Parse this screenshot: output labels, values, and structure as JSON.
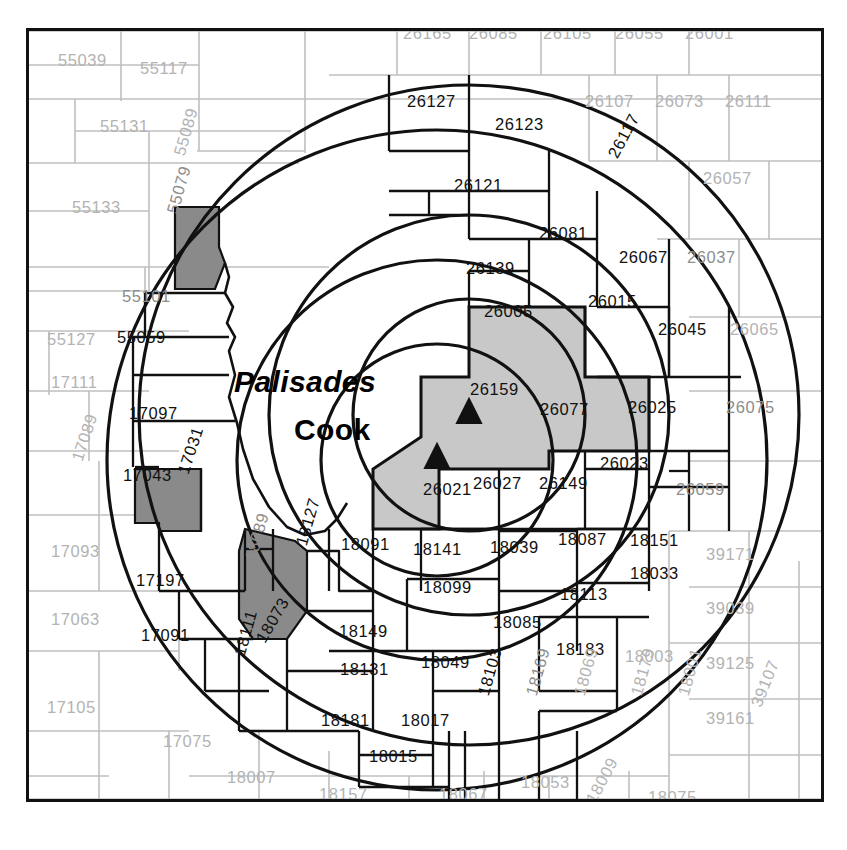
{
  "map": {
    "title": "Nuclear plant emergency planning zone map",
    "width": 847,
    "height": 850,
    "frame": {
      "x": 26,
      "y": 28,
      "w": 792,
      "h": 768
    },
    "background_color": "#ffffff",
    "border_color": "#111111",
    "county_line_inside_color": "#111111",
    "county_line_outside_color": "#b9b9b9",
    "shade_light": "#c8c8c8",
    "shade_dark": "#8a8a8a"
  },
  "sites": [
    {
      "name": "Palisades",
      "label": "Palisades",
      "marker": "triangle-marker",
      "x": 440,
      "y": 384,
      "label_x": 231,
      "label_y": 353
    },
    {
      "name": "Cook",
      "label": "Cook",
      "marker": "triangle-marker",
      "x": 408,
      "y": 429,
      "label_x": 290,
      "label_y": 400
    }
  ],
  "rings": [
    {
      "site": "Palisades",
      "cx": 440,
      "cy": 384,
      "r": 330,
      "name": "palisades-outer-ring"
    },
    {
      "site": "Palisades",
      "cx": 440,
      "cy": 384,
      "r": 200,
      "name": "palisades-mid-ring"
    },
    {
      "site": "Palisades",
      "cx": 440,
      "cy": 384,
      "r": 116,
      "name": "palisades-inner-ring"
    },
    {
      "site": "Cook",
      "cx": 408,
      "cy": 429,
      "r": 330,
      "name": "cook-outer-ring"
    },
    {
      "site": "Cook",
      "cx": 408,
      "cy": 429,
      "r": 200,
      "name": "cook-mid-ring"
    },
    {
      "site": "Cook",
      "cx": 408,
      "cy": 429,
      "r": 116,
      "name": "cook-inner-ring"
    }
  ],
  "shaded_counties": {
    "light": [
      "26005",
      "26159",
      "26077",
      "26021"
    ],
    "dark": [
      "55079",
      "17043",
      "18089"
    ]
  },
  "counties": [
    {
      "fips": "55039",
      "x": 55,
      "y": 49,
      "tone": "outside",
      "rot": 0
    },
    {
      "fips": "55117",
      "x": 137,
      "y": 57,
      "tone": "outside",
      "rot": 0
    },
    {
      "fips": "55131",
      "x": 97,
      "y": 115,
      "tone": "outside",
      "rot": 0
    },
    {
      "fips": "55089",
      "x": 168,
      "y": 150,
      "tone": "outside",
      "rot": -74
    },
    {
      "fips": "55133",
      "x": 69,
      "y": 196,
      "tone": "outside",
      "rot": 0
    },
    {
      "fips": "55079",
      "x": 161,
      "y": 208,
      "tone": "mid",
      "rot": -74
    },
    {
      "fips": "55127",
      "x": 44,
      "y": 328,
      "tone": "outside",
      "rot": 0
    },
    {
      "fips": "55101",
      "x": 119,
      "y": 285,
      "tone": "mid",
      "rot": 0
    },
    {
      "fips": "55059",
      "x": 114,
      "y": 326,
      "tone": "inside",
      "rot": 0
    },
    {
      "fips": "17111",
      "x": 48,
      "y": 371,
      "tone": "outside",
      "rot": 0
    },
    {
      "fips": "17097",
      "x": 126,
      "y": 402,
      "tone": "inside",
      "rot": 0
    },
    {
      "fips": "17089",
      "x": 66,
      "y": 455,
      "tone": "outside",
      "rot": -72
    },
    {
      "fips": "17043",
      "x": 120,
      "y": 464,
      "tone": "inside",
      "rot": 0
    },
    {
      "fips": "17031",
      "x": 172,
      "y": 468,
      "tone": "inside",
      "rot": -72
    },
    {
      "fips": "17093",
      "x": 48,
      "y": 540,
      "tone": "outside",
      "rot": 0
    },
    {
      "fips": "17063",
      "x": 48,
      "y": 608,
      "tone": "outside",
      "rot": 0
    },
    {
      "fips": "17197",
      "x": 133,
      "y": 569,
      "tone": "inside",
      "rot": 0
    },
    {
      "fips": "17091",
      "x": 138,
      "y": 624,
      "tone": "inside",
      "rot": 0
    },
    {
      "fips": "17105",
      "x": 44,
      "y": 696,
      "tone": "outside",
      "rot": 0
    },
    {
      "fips": "17075",
      "x": 160,
      "y": 730,
      "tone": "outside",
      "rot": 0
    },
    {
      "fips": "17053",
      "x": 54,
      "y": 795,
      "tone": "outside",
      "rot": 0
    },
    {
      "fips": "18089",
      "x": 239,
      "y": 555,
      "tone": "mid",
      "rot": -74
    },
    {
      "fips": "18127",
      "x": 290,
      "y": 540,
      "tone": "inside",
      "rot": -74
    },
    {
      "fips": "18073",
      "x": 250,
      "y": 634,
      "tone": "inside",
      "rot": -60
    },
    {
      "fips": "18111",
      "x": 228,
      "y": 650,
      "tone": "inside",
      "rot": -74
    },
    {
      "fips": "18091",
      "x": 338,
      "y": 533,
      "tone": "inside",
      "rot": 0
    },
    {
      "fips": "18141",
      "x": 410,
      "y": 538,
      "tone": "inside",
      "rot": 0
    },
    {
      "fips": "18039",
      "x": 487,
      "y": 536,
      "tone": "inside",
      "rot": 0
    },
    {
      "fips": "18087",
      "x": 555,
      "y": 528,
      "tone": "inside",
      "rot": 0
    },
    {
      "fips": "18151",
      "x": 627,
      "y": 529,
      "tone": "inside",
      "rot": 0
    },
    {
      "fips": "18033",
      "x": 627,
      "y": 562,
      "tone": "inside",
      "rot": 0
    },
    {
      "fips": "18099",
      "x": 420,
      "y": 576,
      "tone": "inside",
      "rot": 0
    },
    {
      "fips": "18113",
      "x": 557,
      "y": 583,
      "tone": "inside",
      "rot": 0
    },
    {
      "fips": "18149",
      "x": 336,
      "y": 620,
      "tone": "inside",
      "rot": 0
    },
    {
      "fips": "18085",
      "x": 490,
      "y": 611,
      "tone": "inside",
      "rot": 0
    },
    {
      "fips": "18183",
      "x": 553,
      "y": 638,
      "tone": "inside",
      "rot": 0
    },
    {
      "fips": "18131",
      "x": 337,
      "y": 658,
      "tone": "inside",
      "rot": 0
    },
    {
      "fips": "18049",
      "x": 418,
      "y": 651,
      "tone": "inside",
      "rot": 0
    },
    {
      "fips": "18003",
      "x": 622,
      "y": 645,
      "tone": "outside",
      "rot": 0
    },
    {
      "fips": "18181",
      "x": 318,
      "y": 709,
      "tone": "inside",
      "rot": 0
    },
    {
      "fips": "18017",
      "x": 398,
      "y": 709,
      "tone": "inside",
      "rot": 0
    },
    {
      "fips": "18015",
      "x": 366,
      "y": 745,
      "tone": "inside",
      "rot": 0
    },
    {
      "fips": "18103",
      "x": 472,
      "y": 690,
      "tone": "inside",
      "rot": -74
    },
    {
      "fips": "18169",
      "x": 520,
      "y": 690,
      "tone": "mid",
      "rot": -74
    },
    {
      "fips": "18069",
      "x": 568,
      "y": 690,
      "tone": "outside",
      "rot": -74
    },
    {
      "fips": "18179",
      "x": 625,
      "y": 690,
      "tone": "outside",
      "rot": -74
    },
    {
      "fips": "18001",
      "x": 672,
      "y": 690,
      "tone": "outside",
      "rot": -74
    },
    {
      "fips": "18007",
      "x": 224,
      "y": 766,
      "tone": "outside",
      "rot": 0
    },
    {
      "fips": "18157",
      "x": 316,
      "y": 783,
      "tone": "outside",
      "rot": 0
    },
    {
      "fips": "18171",
      "x": 232,
      "y": 802,
      "tone": "outside",
      "rot": 0
    },
    {
      "fips": "18067",
      "x": 436,
      "y": 783,
      "tone": "outside",
      "rot": 0
    },
    {
      "fips": "18053",
      "x": 518,
      "y": 771,
      "tone": "outside",
      "rot": 0
    },
    {
      "fips": "18009",
      "x": 580,
      "y": 795,
      "tone": "outside",
      "rot": -62
    },
    {
      "fips": "18075",
      "x": 645,
      "y": 786,
      "tone": "outside",
      "rot": 0
    },
    {
      "fips": "26127",
      "x": 404,
      "y": 90,
      "tone": "inside",
      "rot": 0
    },
    {
      "fips": "26123",
      "x": 492,
      "y": 113,
      "tone": "inside",
      "rot": 0
    },
    {
      "fips": "26107",
      "x": 582,
      "y": 90,
      "tone": "outside",
      "rot": 0
    },
    {
      "fips": "26073",
      "x": 652,
      "y": 90,
      "tone": "outside",
      "rot": 0
    },
    {
      "fips": "26111",
      "x": 722,
      "y": 90,
      "tone": "outside",
      "rot": 0
    },
    {
      "fips": "26121",
      "x": 451,
      "y": 174,
      "tone": "inside",
      "rot": 0
    },
    {
      "fips": "26117",
      "x": 602,
      "y": 150,
      "tone": "inside",
      "rot": -62
    },
    {
      "fips": "26057",
      "x": 700,
      "y": 167,
      "tone": "outside",
      "rot": 0
    },
    {
      "fips": "26081",
      "x": 536,
      "y": 222,
      "tone": "inside",
      "rot": 0
    },
    {
      "fips": "26067",
      "x": 616,
      "y": 246,
      "tone": "inside",
      "rot": 0
    },
    {
      "fips": "26037",
      "x": 684,
      "y": 246,
      "tone": "mid",
      "rot": 0
    },
    {
      "fips": "26139",
      "x": 463,
      "y": 257,
      "tone": "inside",
      "rot": 0
    },
    {
      "fips": "26005",
      "x": 481,
      "y": 300,
      "tone": "inside",
      "rot": 0
    },
    {
      "fips": "26015",
      "x": 585,
      "y": 290,
      "tone": "inside",
      "rot": 0
    },
    {
      "fips": "26045",
      "x": 655,
      "y": 318,
      "tone": "inside",
      "rot": 0
    },
    {
      "fips": "26065",
      "x": 727,
      "y": 318,
      "tone": "outside",
      "rot": 0
    },
    {
      "fips": "26159",
      "x": 467,
      "y": 378,
      "tone": "inside",
      "rot": 0
    },
    {
      "fips": "26077",
      "x": 537,
      "y": 398,
      "tone": "inside",
      "rot": 0
    },
    {
      "fips": "26025",
      "x": 625,
      "y": 396,
      "tone": "inside",
      "rot": 0
    },
    {
      "fips": "26075",
      "x": 723,
      "y": 396,
      "tone": "mid",
      "rot": 0
    },
    {
      "fips": "26021",
      "x": 420,
      "y": 478,
      "tone": "inside",
      "rot": 0
    },
    {
      "fips": "26027",
      "x": 470,
      "y": 472,
      "tone": "inside",
      "rot": 0
    },
    {
      "fips": "26149",
      "x": 536,
      "y": 472,
      "tone": "inside",
      "rot": 0
    },
    {
      "fips": "26023",
      "x": 597,
      "y": 452,
      "tone": "inside",
      "rot": 0
    },
    {
      "fips": "26059",
      "x": 673,
      "y": 478,
      "tone": "mid",
      "rot": 0
    },
    {
      "fips": "39171",
      "x": 703,
      "y": 543,
      "tone": "outside",
      "rot": 0
    },
    {
      "fips": "39039",
      "x": 703,
      "y": 597,
      "tone": "outside",
      "rot": 0
    },
    {
      "fips": "39125",
      "x": 703,
      "y": 652,
      "tone": "outside",
      "rot": 0
    },
    {
      "fips": "39161",
      "x": 703,
      "y": 707,
      "tone": "outside",
      "rot": 0
    },
    {
      "fips": "39107",
      "x": 745,
      "y": 700,
      "tone": "outside",
      "rot": -68
    }
  ],
  "clipped_top_counties": [
    {
      "fips": "26165",
      "x": 400,
      "y": 22
    },
    {
      "fips": "26085",
      "x": 466,
      "y": 22
    },
    {
      "fips": "26105",
      "x": 540,
      "y": 22
    },
    {
      "fips": "26055",
      "x": 612,
      "y": 22
    },
    {
      "fips": "26001",
      "x": 682,
      "y": 22
    }
  ]
}
